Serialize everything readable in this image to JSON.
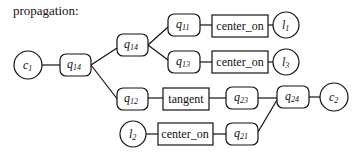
{
  "title": "propagation:",
  "nodes": {
    "c1": {
      "label": "c",
      "sub": "1",
      "shape": "circle"
    },
    "q14a": {
      "label": "q",
      "sub": "14",
      "shape": "rounded-rect"
    },
    "q14b": {
      "label": "q",
      "sub": "14",
      "shape": "rounded-rect"
    },
    "q11": {
      "label": "q",
      "sub": "11",
      "shape": "rounded-rect"
    },
    "co1": {
      "label": "center_on",
      "shape": "rect"
    },
    "l1": {
      "label": "l",
      "sub": "1",
      "shape": "circle"
    },
    "q13": {
      "label": "q",
      "sub": "13",
      "shape": "rounded-rect"
    },
    "co2": {
      "label": "center_on",
      "shape": "rect"
    },
    "l3": {
      "label": "l",
      "sub": "3",
      "shape": "circle"
    },
    "q12": {
      "label": "q",
      "sub": "12",
      "shape": "rounded-rect"
    },
    "tangent": {
      "label": "tangent",
      "shape": "rect"
    },
    "q23": {
      "label": "q",
      "sub": "23",
      "shape": "rounded-rect"
    },
    "q24": {
      "label": "q",
      "sub": "24",
      "shape": "rounded-rect"
    },
    "c2": {
      "label": "c",
      "sub": "2",
      "shape": "circle"
    },
    "l2": {
      "label": "l",
      "sub": "2",
      "shape": "circle"
    },
    "co3": {
      "label": "center_on",
      "shape": "rect"
    },
    "q21": {
      "label": "q",
      "sub": "21",
      "shape": "rounded-rect"
    }
  },
  "edges": [
    [
      "c1",
      "q14a"
    ],
    [
      "q14a",
      "q14b"
    ],
    [
      "q14a",
      "q12"
    ],
    [
      "q14b",
      "q11"
    ],
    [
      "q14b",
      "q13"
    ],
    [
      "q11",
      "co1"
    ],
    [
      "co1",
      "l1"
    ],
    [
      "q13",
      "co2"
    ],
    [
      "co2",
      "l3"
    ],
    [
      "q12",
      "tangent"
    ],
    [
      "tangent",
      "q23"
    ],
    [
      "q23",
      "q24"
    ],
    [
      "q24",
      "c2"
    ],
    [
      "l2",
      "co3"
    ],
    [
      "co3",
      "q21"
    ],
    [
      "q21",
      "q24"
    ]
  ]
}
